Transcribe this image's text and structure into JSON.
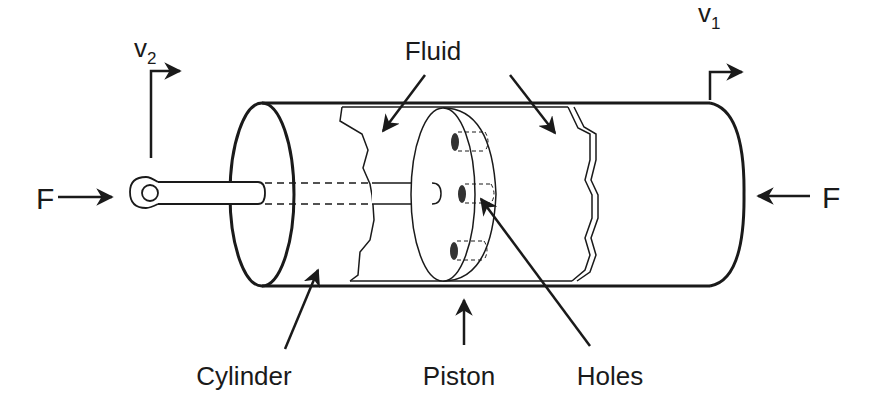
{
  "diagram": {
    "labels": {
      "v2": "v",
      "v2_sub": "2",
      "v1": "v",
      "v1_sub": "1",
      "force_left": "F",
      "force_right": "F",
      "fluid": "Fluid",
      "cylinder": "Cylinder",
      "piston": "Piston",
      "holes": "Holes"
    },
    "colors": {
      "line": "#1a1a1a",
      "background": "#ffffff"
    }
  }
}
